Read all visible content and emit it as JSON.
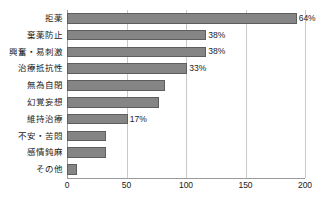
{
  "chart_data": {
    "type": "bar",
    "orientation": "horizontal",
    "title": "",
    "subtitle": "",
    "xlabel": "",
    "ylabel": "",
    "xlim": [
      0,
      200
    ],
    "xticks": [
      "0",
      "50",
      "100",
      "150",
      "200"
    ],
    "xtick_values": [
      0,
      50,
      100,
      150,
      200
    ],
    "grid": true,
    "legend": null,
    "bar_color": "#858585",
    "bar_edge_color": "#5e5e5e",
    "gridline_color": "#c9c9c9",
    "axis_color": "#9a9a9a",
    "text_color": "#1a1a1a",
    "categories": [
      "拒薬",
      "棄薬防止",
      "興奮・易刺激",
      "治療抵抗性",
      "無為自閉",
      "幻覚妄想",
      "維持治療",
      "不安・苦悶",
      "感情鈍麻",
      "その他"
    ],
    "values": [
      193,
      117,
      117,
      101,
      82,
      77,
      51,
      33,
      33,
      8
    ],
    "data_labels": [
      "64%",
      "38%",
      "38%",
      "33%",
      "",
      "",
      "17%",
      "",
      "",
      ""
    ],
    "bars": [
      {
        "category": "拒薬",
        "value": 193,
        "label": "64%"
      },
      {
        "category": "棄薬防止",
        "value": 117,
        "label": "38%"
      },
      {
        "category": "興奮・易刺激",
        "value": 117,
        "label": "38%"
      },
      {
        "category": "治療抵抗性",
        "value": 101,
        "label": "33%"
      },
      {
        "category": "無為自閉",
        "value": 82,
        "label": ""
      },
      {
        "category": "幻覚妄想",
        "value": 77,
        "label": ""
      },
      {
        "category": "維持治療",
        "value": 51,
        "label": "17%"
      },
      {
        "category": "不安・苦悶",
        "value": 33,
        "label": ""
      },
      {
        "category": "感情鈍麻",
        "value": 33,
        "label": ""
      },
      {
        "category": "その他",
        "value": 8,
        "label": ""
      }
    ]
  }
}
